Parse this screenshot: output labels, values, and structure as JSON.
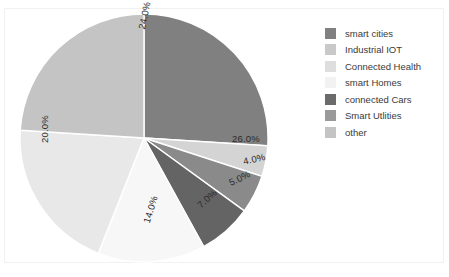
{
  "chart_data": {
    "type": "pie",
    "title": "",
    "labels": [
      "smart cities",
      "Industrial IOT",
      "Connected Health",
      "smart Homes",
      "connected Cars",
      "Smart Utlities",
      "other"
    ],
    "values": [
      26.0,
      4.0,
      5.0,
      7.0,
      14.0,
      20.0,
      24.0
    ],
    "value_labels": [
      "26.0%",
      "4.0%",
      "5.0%",
      "7.0%",
      "14.0%",
      "20.0%",
      "24.0%"
    ],
    "colors": [
      "#808080",
      "#c9c9c9",
      "#d8d8d8",
      "#f6f6f6",
      "#646464",
      "#8a8a8a",
      "#bdbdbd"
    ],
    "wedge_colors_clockwise": [
      "#808080",
      "#d4d4d4",
      "#8a8a8a",
      "#646464",
      "#f7f7f7",
      "#e8e8e8",
      "#c4c4c4"
    ],
    "start_angle": 90,
    "direction": "clockwise",
    "legend_position": "right",
    "grid": false,
    "xlabel": "",
    "ylabel": ""
  },
  "legend": {
    "items": [
      {
        "label": "smart cities",
        "color": "#808080"
      },
      {
        "label": "Industrial IOT",
        "color": "#c9c9c9"
      },
      {
        "label": "Connected Health",
        "color": "#dedede"
      },
      {
        "label": "smart Homes",
        "color": "#f2f2f2"
      },
      {
        "label": "connected Cars",
        "color": "#6b6b6b"
      },
      {
        "label": "Smart Utlities",
        "color": "#9a9a9a"
      },
      {
        "label": "other",
        "color": "#c4c4c4"
      }
    ]
  },
  "figure": {
    "background": "#ffffff",
    "border_color": "#f1f1f1"
  }
}
